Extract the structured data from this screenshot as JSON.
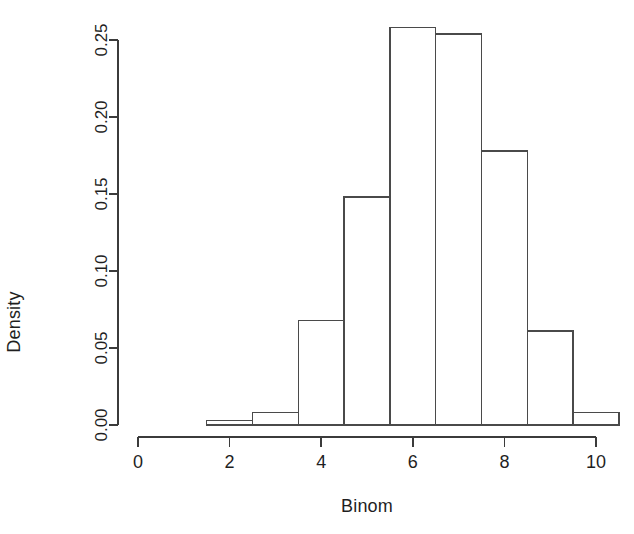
{
  "chart_data": {
    "type": "bar",
    "subtype": "histogram",
    "title": "",
    "subtitle": "",
    "xlabel": "Binom",
    "ylabel": "Density",
    "grid": false,
    "legend": null,
    "xlim": [
      0,
      10
    ],
    "ylim": [
      0.0,
      0.25
    ],
    "xticks": [
      0,
      2,
      4,
      6,
      8,
      10
    ],
    "xtick_labels": [
      "0",
      "2",
      "4",
      "6",
      "8",
      "10"
    ],
    "yticks": [
      0.0,
      0.05,
      0.1,
      0.15,
      0.2,
      0.25
    ],
    "ytick_labels": [
      "0.00",
      "0.05",
      "0.10",
      "0.15",
      "0.20",
      "0.25"
    ],
    "bin_edges": [
      1.5,
      2.5,
      3.5,
      4.5,
      5.5,
      6.5,
      7.5,
      8.5,
      9.5,
      10.5
    ],
    "bin_centers": [
      2,
      3,
      4,
      5,
      6,
      7,
      8,
      9,
      10
    ],
    "categories": [
      "2",
      "3",
      "4",
      "5",
      "6",
      "7",
      "8",
      "9",
      "10"
    ],
    "values": [
      0.003,
      0.008,
      0.068,
      0.148,
      0.258,
      0.254,
      0.178,
      0.061,
      0.008
    ]
  },
  "axes": {
    "x_label": "Binom",
    "y_label": "Density"
  },
  "colors": {
    "bar_stroke": "#4a4a4a",
    "bar_fill": "none",
    "axis": "#3b3b3b",
    "text": "#1f1f1f",
    "background": "#ffffff"
  }
}
